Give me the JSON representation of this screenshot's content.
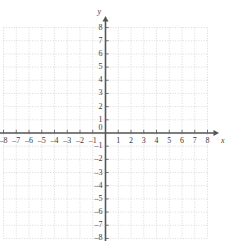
{
  "figure": {
    "kind": "cartesian-coordinate-grid",
    "width": 225,
    "height": 241,
    "background_color": "#ffffff"
  },
  "axes": {
    "x": {
      "label": "x",
      "min": -8,
      "max": 8,
      "step": 1,
      "has_arrow_positive": true,
      "has_arrow_negative": false,
      "color": "#555555",
      "tick_labels": [
        "–8",
        "–7",
        "–6",
        "–5",
        "–4",
        "–3",
        "–2",
        "–1",
        "1",
        "2",
        "3",
        "4",
        "5",
        "6",
        "7",
        "8"
      ],
      "tick_values": [
        -8,
        -7,
        -6,
        -5,
        -4,
        -3,
        -2,
        -1,
        1,
        2,
        3,
        4,
        5,
        6,
        7,
        8
      ]
    },
    "y": {
      "label": "y",
      "min": -8,
      "max": 8,
      "step": 1,
      "has_arrow_positive": true,
      "has_arrow_negative": false,
      "color": "#555555",
      "tick_labels": [
        "8",
        "7",
        "6",
        "5",
        "4",
        "3",
        "2",
        "1",
        "–1",
        "–2",
        "–3",
        "–4",
        "–5",
        "–6",
        "–7",
        "–8"
      ],
      "tick_values": [
        8,
        7,
        6,
        5,
        4,
        3,
        2,
        1,
        -1,
        -2,
        -3,
        -4,
        -5,
        -6,
        -7,
        -8
      ]
    }
  },
  "origin": {
    "label": "0",
    "x": 0,
    "y": 0
  },
  "grid": {
    "visible": true,
    "style": "dotted",
    "color": "#c8c8c8",
    "x_min": -8,
    "x_max": 8,
    "y_min": -8,
    "y_max": 8,
    "spacing_units": 1
  },
  "data_points": [],
  "annotations": []
}
